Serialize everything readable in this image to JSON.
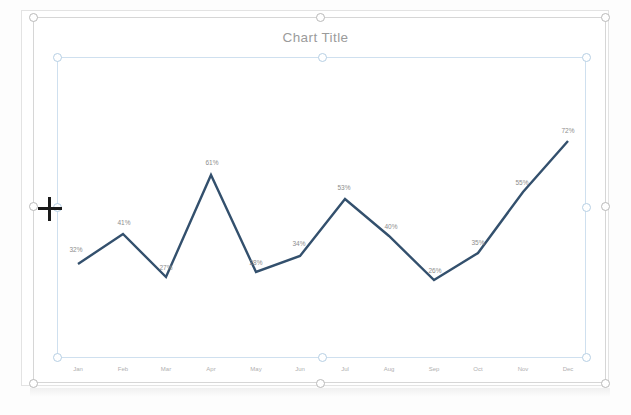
{
  "app": {
    "surface": "slide-canvas",
    "selection_state": "chart-object-selected"
  },
  "chart": {
    "title": "Chart Title",
    "line_color": "#33506d",
    "label_color": "#8d8d8d",
    "title_color": "#9b9b9b",
    "plot_frame_color": "#cfe0ef",
    "selection_frame_color": "#d6d6d6"
  },
  "cursor": {
    "name": "move-crosshair-cursor",
    "x": 50,
    "y": 209
  },
  "chart_data": {
    "type": "line",
    "title": "Chart Title",
    "xlabel": "",
    "ylabel": "",
    "categories": [
      "Jan",
      "Feb",
      "Mar",
      "Apr",
      "May",
      "Jun",
      "Jul",
      "Aug",
      "Sep",
      "Oct",
      "Nov",
      "Dec"
    ],
    "values": [
      32,
      41,
      27,
      61,
      28,
      34,
      53,
      40,
      26,
      35,
      55,
      72
    ],
    "value_labels": [
      "32%",
      "41%",
      "27%",
      "61%",
      "28%",
      "34%",
      "53%",
      "40%",
      "26%",
      "35%",
      "55%",
      "72%"
    ],
    "series": [
      {
        "name": "Series 1",
        "values": [
          32,
          41,
          27,
          61,
          28,
          34,
          53,
          40,
          26,
          35,
          55,
          72
        ],
        "color": "#33506d"
      }
    ],
    "ylim": [
      0,
      80
    ],
    "grid": false,
    "legend": false,
    "data_labels": true,
    "markers": false
  },
  "handles": {
    "outer": [
      {
        "name": "handle-top-left",
        "x": 33,
        "y": 17
      },
      {
        "name": "handle-top-center",
        "x": 320,
        "y": 17
      },
      {
        "name": "handle-top-right",
        "x": 605,
        "y": 17
      },
      {
        "name": "handle-middle-left",
        "x": 33,
        "y": 206
      },
      {
        "name": "handle-middle-right",
        "x": 605,
        "y": 206
      },
      {
        "name": "handle-bottom-left",
        "x": 33,
        "y": 383
      },
      {
        "name": "handle-bottom-center",
        "x": 320,
        "y": 383
      },
      {
        "name": "handle-bottom-right",
        "x": 605,
        "y": 383
      }
    ],
    "inner": [
      {
        "name": "plot-handle-top-left",
        "x": 57,
        "y": 57
      },
      {
        "name": "plot-handle-top-center",
        "x": 322,
        "y": 57
      },
      {
        "name": "plot-handle-top-right",
        "x": 586,
        "y": 57
      },
      {
        "name": "plot-handle-middle-left",
        "x": 57,
        "y": 207
      },
      {
        "name": "plot-handle-middle-right",
        "x": 586,
        "y": 207
      },
      {
        "name": "plot-handle-bottom-left",
        "x": 57,
        "y": 357
      },
      {
        "name": "plot-handle-bottom-center",
        "x": 322,
        "y": 357
      },
      {
        "name": "plot-handle-bottom-right",
        "x": 586,
        "y": 357
      }
    ]
  },
  "geometry": {
    "points": [
      {
        "x": 78,
        "y": 264
      },
      {
        "x": 123,
        "y": 234
      },
      {
        "x": 166,
        "y": 277
      },
      {
        "x": 211,
        "y": 175
      },
      {
        "x": 256,
        "y": 272
      },
      {
        "x": 300,
        "y": 256
      },
      {
        "x": 345,
        "y": 199
      },
      {
        "x": 389,
        "y": 236
      },
      {
        "x": 434,
        "y": 280
      },
      {
        "x": 478,
        "y": 253
      },
      {
        "x": 523,
        "y": 192
      },
      {
        "x": 568,
        "y": 141
      }
    ],
    "label_offsets": [
      {
        "x": 76,
        "y": 249
      },
      {
        "x": 124,
        "y": 222
      },
      {
        "x": 166,
        "y": 267
      },
      {
        "x": 212,
        "y": 162
      },
      {
        "x": 256,
        "y": 262
      },
      {
        "x": 299,
        "y": 243
      },
      {
        "x": 344,
        "y": 187
      },
      {
        "x": 391,
        "y": 226
      },
      {
        "x": 435,
        "y": 270
      },
      {
        "x": 478,
        "y": 242
      },
      {
        "x": 522,
        "y": 182
      },
      {
        "x": 568,
        "y": 130
      }
    ],
    "category_x": [
      78,
      123,
      166,
      211,
      256,
      300,
      345,
      389,
      434,
      478,
      523,
      568
    ]
  }
}
